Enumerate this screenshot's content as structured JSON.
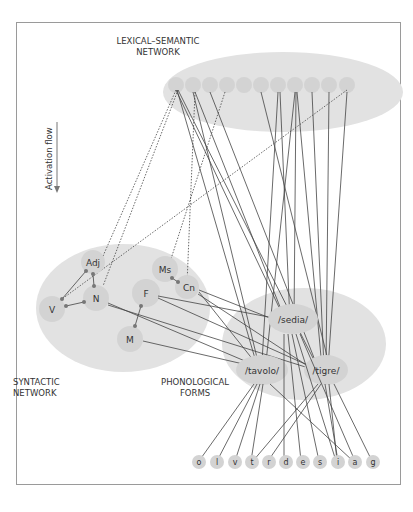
{
  "labels": {
    "lexical": [
      "LEXICAL–SEMANTIC",
      "NETWORK"
    ],
    "syntactic": [
      "SYNTACTIC",
      "NETWORK"
    ],
    "phonological": [
      "PHONOLOGICAL",
      "FORMS"
    ],
    "activation_flow": "Activation flow"
  },
  "syntactic_nodes": {
    "adj": "Adj",
    "n": "N",
    "v": "V",
    "ms": "Ms",
    "cn": "Cn",
    "f": "F",
    "m": "M"
  },
  "word_forms": {
    "sedia": "/sedia/",
    "tavolo": "/tavolo/",
    "tigre": "/tigre/"
  },
  "phonemes": [
    "o",
    "l",
    "v",
    "t",
    "r",
    "d",
    "e",
    "s",
    "i",
    "a",
    "g"
  ],
  "colors": {
    "ellipse": "#e2e2e2",
    "node": "#d3d3d3",
    "line": "#444444",
    "dot": "#777777",
    "border": "#9a9a9a"
  }
}
